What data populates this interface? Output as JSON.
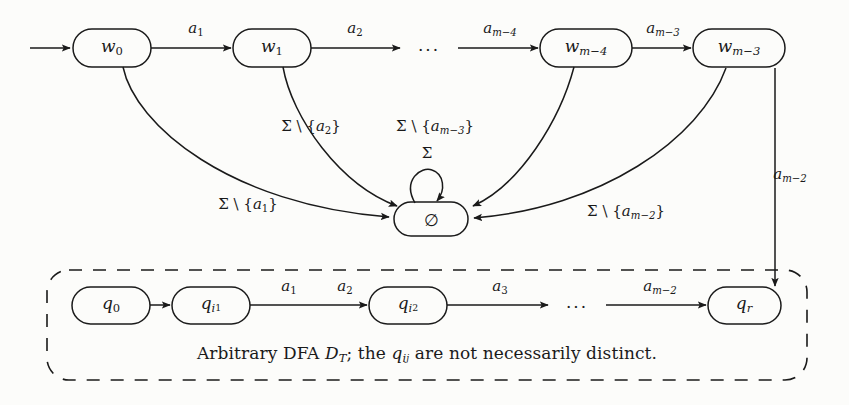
{
  "figure": {
    "background_color": "#fcfcfa",
    "ink_color": "#1a1a1a"
  },
  "top_row": {
    "start_arrow": "start-arrow",
    "states": [
      {
        "name": "w0",
        "label_base": "w",
        "label_sub": "0",
        "cx": 112,
        "cy": 48
      },
      {
        "name": "w1",
        "label_base": "w",
        "label_sub": "1",
        "cx": 272,
        "cy": 48
      },
      {
        "name": "wm4",
        "label_base": "w",
        "label_sub": "m−4",
        "cx": 586,
        "cy": 48
      },
      {
        "name": "wm3",
        "label_base": "w",
        "label_sub": "m−3",
        "cx": 739,
        "cy": 48
      }
    ],
    "ellipsis": "···",
    "transitions": [
      {
        "name": "a1",
        "label_base": "a",
        "label_sub": "1",
        "x": 196,
        "y": 30
      },
      {
        "name": "a2",
        "label_base": "a",
        "label_sub": "2",
        "x": 355,
        "y": 30
      },
      {
        "name": "am4",
        "label_base": "a",
        "label_sub": "m−4",
        "x": 500,
        "y": 30
      },
      {
        "name": "am3",
        "label_base": "a",
        "label_sub": "m−3",
        "x": 663,
        "y": 30
      }
    ]
  },
  "sink": {
    "name": "empty-set-state",
    "label": "∅",
    "cx": 431,
    "cy": 219,
    "self_loop_label": "Σ",
    "self_loop_label_x": 427,
    "self_loop_label_y": 153
  },
  "sink_edges": [
    {
      "name": "sigma-minus-a1",
      "sigma": "Σ \\ {",
      "base": "a",
      "sub": "1",
      "close": "}",
      "x": 248,
      "y": 206
    },
    {
      "name": "sigma-minus-a2",
      "sigma": "Σ \\ {",
      "base": "a",
      "sub": "2",
      "close": "}",
      "x": 311,
      "y": 128
    },
    {
      "name": "sigma-minus-am3",
      "sigma": "Σ \\ {",
      "base": "a",
      "sub": "m−3",
      "close": "}",
      "x": 435,
      "y": 128
    },
    {
      "name": "sigma-minus-am2",
      "sigma": "Σ \\ {",
      "base": "a",
      "sub": "m−2",
      "close": "}",
      "x": 626,
      "y": 213
    }
  ],
  "vertical_edge": {
    "name": "am2-down",
    "label_base": "a",
    "label_sub": "m−2",
    "x": 790,
    "y": 176
  },
  "dashed_box": {
    "name": "arbitrary-dfa-box",
    "x": 47,
    "y": 270,
    "width": 760,
    "height": 110,
    "caption_parts": {
      "lead": "Arbitrary DFA ",
      "cal": "D",
      "cal_sub": "T",
      "mid": "; the ",
      "q": "q",
      "q_sub": "i",
      "q_sub2": "j",
      "tail": " are not necessarily distinct."
    },
    "caption_x": 427,
    "caption_y": 355
  },
  "bottom_row": {
    "states": [
      {
        "name": "q0",
        "label_base": "q",
        "label_sub": "0",
        "label_sub2": "",
        "cx": 111,
        "cy": 305
      },
      {
        "name": "qi1",
        "label_base": "q",
        "label_sub": "i",
        "label_sub2": "1",
        "cx": 211,
        "cy": 305
      },
      {
        "name": "qi2",
        "label_base": "q",
        "label_sub": "i",
        "label_sub2": "2",
        "cx": 408,
        "cy": 305
      },
      {
        "name": "qr",
        "label_base": "q",
        "label_sub": "r",
        "label_sub2": "",
        "cx": 744,
        "cy": 305
      }
    ],
    "ellipsis": "···",
    "transitions": [
      {
        "name": "b-a1",
        "label_base": "a",
        "label_sub": "1",
        "x": 289,
        "y": 288
      },
      {
        "name": "b-a2",
        "label_base": "a",
        "label_sub": "2",
        "x": 345,
        "y": 288
      },
      {
        "name": "b-a3",
        "label_base": "a",
        "label_sub": "3",
        "x": 500,
        "y": 288
      },
      {
        "name": "b-am2",
        "label_base": "a",
        "label_sub": "m−2",
        "x": 660,
        "y": 288
      }
    ]
  }
}
